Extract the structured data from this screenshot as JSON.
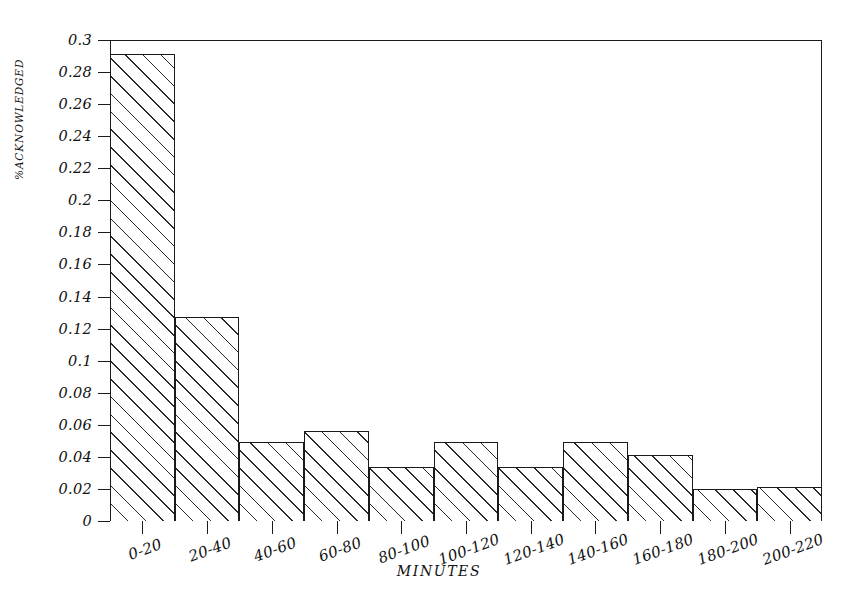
{
  "chart_data": {
    "type": "bar",
    "title": "",
    "subtitle": "",
    "xlabel": "MINUTES",
    "ylabel": "%ACKNOWLEDGED",
    "categories": [
      "0-20",
      "20-40",
      "40-60",
      "60-80",
      "80-100",
      "100-120",
      "120-140",
      "140-160",
      "160-180",
      "180-200",
      "200-220"
    ],
    "values": [
      0.291,
      0.127,
      0.049,
      0.056,
      0.034,
      0.049,
      0.034,
      0.049,
      0.041,
      0.02,
      0.021
    ],
    "ylim": [
      0,
      0.3
    ],
    "yticks": [
      0,
      0.02,
      0.04,
      0.06,
      0.08,
      0.1,
      0.12,
      0.14,
      0.16,
      0.18,
      0.2,
      0.22,
      0.24,
      0.26,
      0.28,
      0.3
    ],
    "ytick_labels": [
      "0",
      "0.02",
      "0.04",
      "0.06",
      "0.08",
      "0.1",
      "0.12",
      "0.14",
      "0.16",
      "0.18",
      "0.2",
      "0.22",
      "0.24",
      "0.26",
      "0.28",
      "0.3"
    ],
    "grid": false,
    "legend": null,
    "bar_style": {
      "fill": "#ffffff",
      "edge": "#1a1a1a",
      "hatch": "diagonal-45",
      "gap": 0
    },
    "frame_color": "#1a1a1a",
    "background": "#ffffff"
  }
}
